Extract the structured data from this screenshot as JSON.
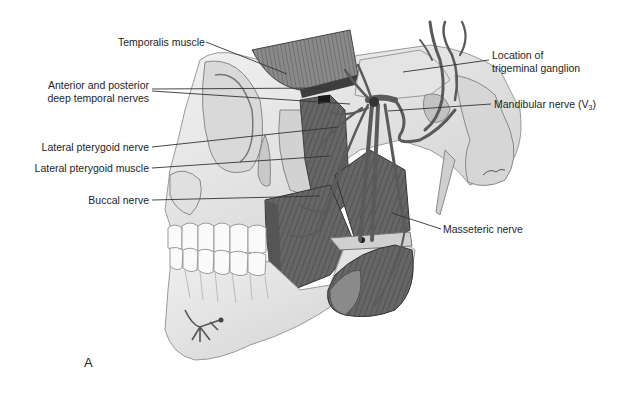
{
  "figure": {
    "panel_letter": "A",
    "colors": {
      "bone": "#e8e8e8",
      "bone_shadow": "#b8b8b8",
      "muscle": "#6e6e6e",
      "muscle_dark": "#4a4a4a",
      "nerve": "#5a5a5a",
      "leader_line": "#333333",
      "teeth": "#fafafa"
    },
    "labels": {
      "temporalis_muscle": "Temporalis muscle",
      "deep_temporal_nerves_line1": "Anterior and posterior",
      "deep_temporal_nerves_line2": "deep temporal nerves",
      "lateral_pterygoid_nerve": "Lateral pterygoid nerve",
      "lateral_pterygoid_muscle": "Lateral pterygoid muscle",
      "buccal_nerve": "Buccal nerve",
      "trigeminal_ganglion_line1": "Location of",
      "trigeminal_ganglion_line2": "trigeminal ganglion",
      "mandibular_nerve_text": "Mandibular nerve (V",
      "mandibular_nerve_sub": "3",
      "mandibular_nerve_close": ")",
      "masseteric_nerve": "Masseteric nerve"
    }
  }
}
